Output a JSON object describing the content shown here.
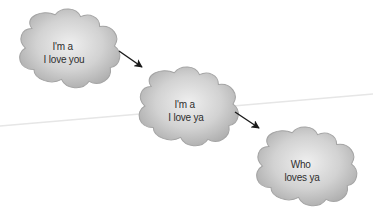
{
  "diagram": {
    "type": "flow",
    "background_color": "#ffffff",
    "guide_line_color": "#e8e8e8",
    "cloud_fill": "#c9c9c9",
    "cloud_edge": "#a6a6a6",
    "cloud_highlight": "#ececec",
    "arrow_color": "#1a1a1a",
    "nodes": [
      {
        "id": "cloud-1",
        "lines": [
          "I'm a",
          "I love you"
        ],
        "center": [
          66,
          52
        ]
      },
      {
        "id": "cloud-2",
        "lines": [
          "I'm a",
          "I love ya"
        ],
        "center": [
          187,
          110
        ]
      },
      {
        "id": "cloud-3",
        "lines": [
          "Who",
          "loves ya"
        ],
        "center": [
          305,
          170
        ]
      }
    ],
    "edges": [
      {
        "from": "cloud-1",
        "to": "cloud-2"
      },
      {
        "from": "cloud-2",
        "to": "cloud-3"
      }
    ]
  }
}
